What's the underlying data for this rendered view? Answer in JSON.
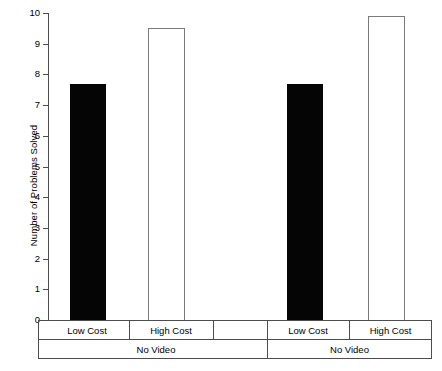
{
  "chart_data": {
    "type": "bar",
    "title": "",
    "xlabel": "",
    "ylabel": "Number of Problems Solved",
    "ylim": [
      0,
      10
    ],
    "yticks": [
      0,
      1,
      2,
      3,
      4,
      5,
      6,
      7,
      8,
      9,
      10
    ],
    "ytick_labels": [
      "0",
      "1",
      "2",
      "3",
      "4",
      "5",
      "6",
      "7",
      "8",
      "9",
      "10"
    ],
    "grid": false,
    "legend": "none",
    "categories": [
      "Low Cost",
      "High Cost",
      "Low Cost",
      "High Cost"
    ],
    "values": [
      7.7,
      9.5,
      7.7,
      9.9
    ],
    "bar_styles": [
      "filled",
      "open",
      "filled",
      "open"
    ],
    "groups": [
      {
        "label": "No Video",
        "bars": [
          {
            "label": "Low Cost",
            "value": 7.7,
            "style": "filled"
          },
          {
            "label": "High Cost",
            "value": 9.5,
            "style": "open"
          }
        ]
      },
      {
        "label": "No Video",
        "bars": [
          {
            "label": "Low Cost",
            "value": 7.7,
            "style": "filled"
          },
          {
            "label": "High Cost",
            "value": 9.9,
            "style": "open"
          }
        ]
      }
    ],
    "colors": {
      "filled_bar": "#050505",
      "open_bar_fill": "#ffffff",
      "open_bar_stroke": "#7a7a7a",
      "axis": "#4d4d4d",
      "background": "#ffffff",
      "text": "#000000"
    }
  },
  "axis": {
    "y_title": "Number of Problems Solved",
    "y_ticks": [
      "10",
      "9",
      "8",
      "7",
      "6",
      "5",
      "4",
      "3",
      "2",
      "1",
      "0"
    ]
  },
  "x_axis_rows": {
    "row1": [
      {
        "label": "Low Cost",
        "left": 6,
        "width": 84
      },
      {
        "label": "High Cost",
        "left": 90,
        "width": 84
      },
      {
        "label": "",
        "left": 174,
        "width": 54
      },
      {
        "label": "Low Cost",
        "left": 228,
        "width": 82
      },
      {
        "label": "High Cost",
        "left": 310,
        "width": 83
      }
    ],
    "row2": [
      {
        "label": "No Video",
        "left": 6,
        "width": 222
      },
      {
        "label": "No Video",
        "left": 228,
        "width": 165
      }
    ]
  }
}
